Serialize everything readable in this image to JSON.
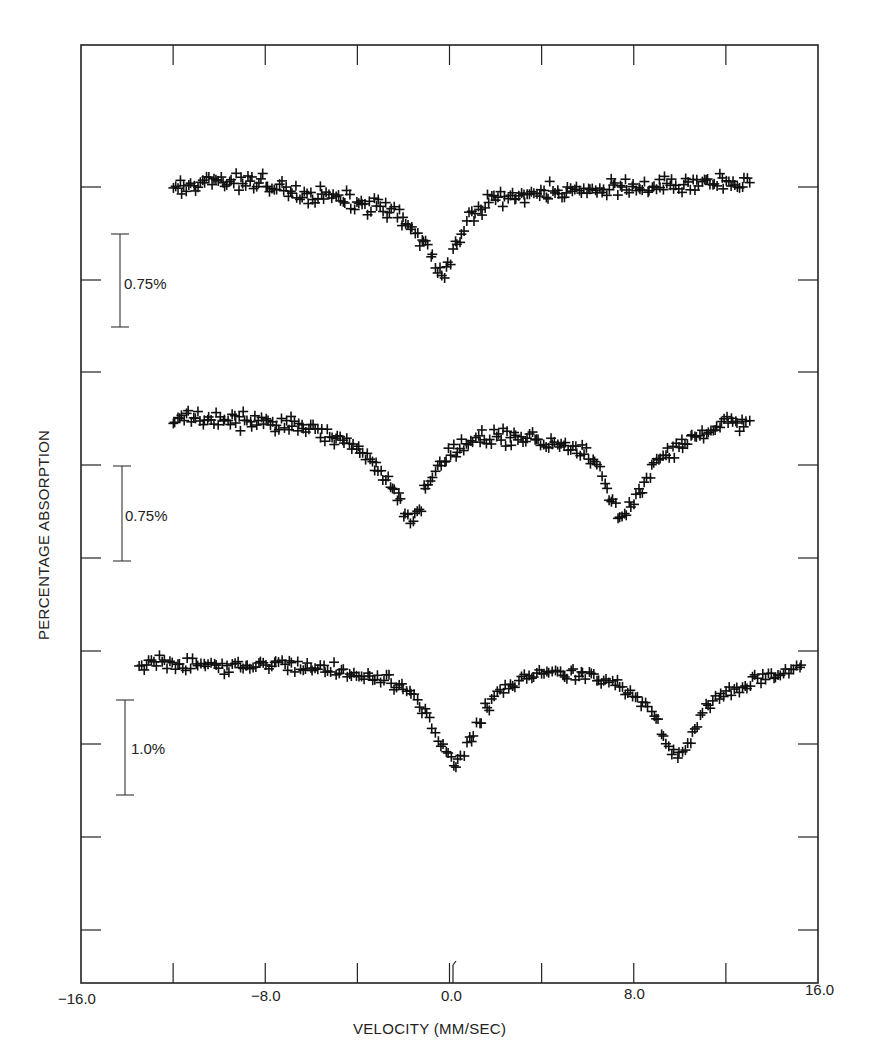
{
  "chart_data": {
    "type": "scatter",
    "title": "",
    "xlabel": "VELOCITY (MM/SEC)",
    "ylabel": "PERCENTAGE ABSORPTION",
    "xlim": [
      -16.0,
      16.0
    ],
    "x_tick_labels": [
      "-16.0",
      "-8.0",
      "0.0",
      "8.0",
      "16.0"
    ],
    "x_ticks": [
      -16,
      -12,
      -8,
      -4,
      0,
      4,
      8,
      12,
      16
    ],
    "grid": false,
    "marker": "+",
    "legend": null,
    "scale_bars": [
      {
        "label": "0.75%",
        "series": "top"
      },
      {
        "label": "0.75%",
        "series": "middle"
      },
      {
        "label": "1.0%",
        "series": "bottom"
      }
    ],
    "series": [
      {
        "name": "top",
        "description": "Single broad absorption line",
        "velocity_range": [
          -12.0,
          13.0
        ],
        "baseline_left_px": 187,
        "baseline_right_px": 200,
        "minima": [
          {
            "velocity": -0.3,
            "depth_pct": 0.75
          }
        ],
        "x": [
          -12.0,
          -11.0,
          -10.0,
          -9.0,
          -8.0,
          -7.0,
          -6.0,
          -5.0,
          -4.0,
          -3.0,
          -2.5,
          -2.0,
          -1.5,
          -1.0,
          -0.7,
          -0.3,
          0.0,
          0.3,
          0.6,
          1.0,
          1.5,
          2.0,
          3.0,
          4.0,
          5.0,
          6.0,
          7.0,
          8.0,
          9.0,
          10.0,
          11.0,
          12.0,
          13.0
        ],
        "y_pct": [
          0.0,
          0.02,
          -0.04,
          -0.03,
          0.0,
          0.05,
          0.09,
          0.1,
          0.15,
          0.2,
          0.24,
          0.3,
          0.38,
          0.5,
          0.62,
          0.75,
          0.65,
          0.5,
          0.35,
          0.25,
          0.17,
          0.1,
          0.08,
          0.07,
          0.06,
          0.06,
          0.05,
          0.04,
          0.02,
          0.0,
          -0.02,
          -0.02,
          0.01
        ]
      },
      {
        "name": "middle",
        "description": "Two-line spectrum (quadrupole-split doublet with asymmetric baseline)",
        "velocity_range": [
          -12.0,
          13.0
        ],
        "baseline_left_px": 420,
        "minima": [
          {
            "velocity": -1.8,
            "depth_pct": 0.82
          },
          {
            "velocity": 7.5,
            "depth_pct": 0.78
          }
        ],
        "x": [
          -12.0,
          -11.0,
          -10.0,
          -9.0,
          -8.0,
          -7.0,
          -6.0,
          -5.0,
          -4.0,
          -3.0,
          -2.5,
          -2.0,
          -1.7,
          -1.3,
          -1.0,
          -0.5,
          0.0,
          1.0,
          2.0,
          3.0,
          4.0,
          5.0,
          6.0,
          6.5,
          7.0,
          7.5,
          8.0,
          8.5,
          9.0,
          10.0,
          11.0,
          12.0,
          13.0
        ],
        "y_pct": [
          0.0,
          0.0,
          0.01,
          0.03,
          0.04,
          0.06,
          0.1,
          0.15,
          0.25,
          0.4,
          0.55,
          0.72,
          0.8,
          0.72,
          0.55,
          0.4,
          0.3,
          0.18,
          0.14,
          0.16,
          0.19,
          0.22,
          0.3,
          0.42,
          0.62,
          0.78,
          0.65,
          0.48,
          0.35,
          0.22,
          0.12,
          0.06,
          0.02
        ]
      },
      {
        "name": "bottom",
        "description": "Two-line spectrum (wider splitting)",
        "velocity_range": [
          -13.5,
          15.3
        ],
        "baseline_left_px": 665,
        "minima": [
          {
            "velocity": 0.3,
            "depth_pct": 1.05
          },
          {
            "velocity": 10.0,
            "depth_pct": 0.98
          }
        ],
        "x": [
          -13.5,
          -12.0,
          -11.0,
          -10.0,
          -9.0,
          -8.0,
          -7.0,
          -6.0,
          -5.0,
          -4.0,
          -3.0,
          -2.0,
          -1.5,
          -1.0,
          -0.5,
          0.0,
          0.3,
          0.6,
          1.0,
          1.5,
          2.0,
          3.0,
          4.0,
          5.0,
          6.0,
          7.0,
          7.5,
          8.0,
          8.5,
          9.0,
          9.5,
          10.0,
          10.5,
          11.0,
          12.0,
          13.0,
          14.0,
          15.3
        ],
        "y_pct": [
          0.0,
          -0.02,
          0.0,
          0.01,
          0.02,
          0.02,
          0.01,
          0.03,
          0.05,
          0.1,
          0.14,
          0.22,
          0.35,
          0.55,
          0.78,
          0.98,
          1.05,
          0.95,
          0.72,
          0.48,
          0.32,
          0.16,
          0.1,
          0.09,
          0.1,
          0.16,
          0.24,
          0.33,
          0.45,
          0.6,
          0.9,
          0.98,
          0.75,
          0.48,
          0.3,
          0.2,
          0.12,
          0.05
        ]
      }
    ]
  },
  "axes": {
    "x_label": "VELOCITY (MM/SEC)",
    "y_label": "PERCENTAGE ABSORPTION",
    "tick_labels": {
      "m16": "−16.0",
      "m8": "−8.0",
      "zero": "0.0",
      "p8": "8.0",
      "p16": "16.0"
    }
  },
  "scale_bars": {
    "top": "0.75%",
    "middle": "0.75%",
    "bottom": "1.0%"
  }
}
